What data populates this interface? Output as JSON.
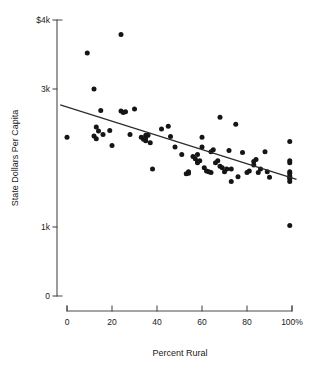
{
  "chart_data": {
    "type": "scatter",
    "title": "",
    "xlabel": "Percent Rural",
    "ylabel": "State Dollars Per Capita",
    "xlim": [
      0,
      100
    ],
    "ylim": [
      0,
      4000
    ],
    "grid": false,
    "legend": null,
    "xticks": [
      0,
      20,
      40,
      60,
      80,
      100
    ],
    "xticklabels": [
      "0",
      "20",
      "40",
      "60",
      "80",
      "100%"
    ],
    "yticks": [
      0,
      1000,
      3000,
      4000
    ],
    "yticklabels": [
      "0",
      "1k",
      "3k",
      "$4k"
    ],
    "series": [
      {
        "name": "States",
        "marker": "circle",
        "color": "#151515",
        "points": [
          [
            0,
            2300
          ],
          [
            9,
            3520
          ],
          [
            12,
            3000
          ],
          [
            12,
            2320
          ],
          [
            13,
            2450
          ],
          [
            13,
            2280
          ],
          [
            14,
            2390
          ],
          [
            15,
            2690
          ],
          [
            16,
            2340
          ],
          [
            19,
            2400
          ],
          [
            20,
            2180
          ],
          [
            24,
            3790
          ],
          [
            24,
            2680
          ],
          [
            25,
            2660
          ],
          [
            26,
            2670
          ],
          [
            28,
            2340
          ],
          [
            30,
            2710
          ],
          [
            33,
            2300
          ],
          [
            34,
            2270
          ],
          [
            35,
            2330
          ],
          [
            35,
            2300
          ],
          [
            35,
            2250
          ],
          [
            36,
            2330
          ],
          [
            37,
            2220
          ],
          [
            38,
            1840
          ],
          [
            42,
            2420
          ],
          [
            45,
            2460
          ],
          [
            46,
            2310
          ],
          [
            48,
            2160
          ],
          [
            51,
            2050
          ],
          [
            53,
            1770
          ],
          [
            54,
            1800
          ],
          [
            54,
            1780
          ],
          [
            56,
            2020
          ],
          [
            57,
            1990
          ],
          [
            58,
            1950
          ],
          [
            58,
            1930
          ],
          [
            58,
            2050
          ],
          [
            59,
            1960
          ],
          [
            60,
            2160
          ],
          [
            60,
            2300
          ],
          [
            61,
            1860
          ],
          [
            62,
            1810
          ],
          [
            63,
            1800
          ],
          [
            64,
            2090
          ],
          [
            64,
            1790
          ],
          [
            65,
            2120
          ],
          [
            66,
            1930
          ],
          [
            67,
            1960
          ],
          [
            68,
            2590
          ],
          [
            68,
            1880
          ],
          [
            69,
            1860
          ],
          [
            70,
            1800
          ],
          [
            71,
            1840
          ],
          [
            72,
            2110
          ],
          [
            73,
            1840
          ],
          [
            73,
            1660
          ],
          [
            75,
            2490
          ],
          [
            76,
            1730
          ],
          [
            78,
            2080
          ],
          [
            80,
            1790
          ],
          [
            81,
            1810
          ],
          [
            83,
            1950
          ],
          [
            83,
            1900
          ],
          [
            84,
            1980
          ],
          [
            85,
            1790
          ],
          [
            86,
            1840
          ],
          [
            88,
            2090
          ],
          [
            89,
            1800
          ],
          [
            90,
            1720
          ],
          [
            99,
            2240
          ],
          [
            99,
            1960
          ],
          [
            99,
            1930
          ],
          [
            99,
            1800
          ],
          [
            99,
            1780
          ],
          [
            99,
            1740
          ],
          [
            99,
            1720
          ],
          [
            99,
            1700
          ],
          [
            99,
            1660
          ],
          [
            99,
            1020
          ]
        ]
      }
    ],
    "trendline": {
      "name": "least-squares fit",
      "color": "#2b2b2b",
      "x_start": -3,
      "y_start": 2770,
      "x_end": 102,
      "y_end": 1690
    }
  }
}
